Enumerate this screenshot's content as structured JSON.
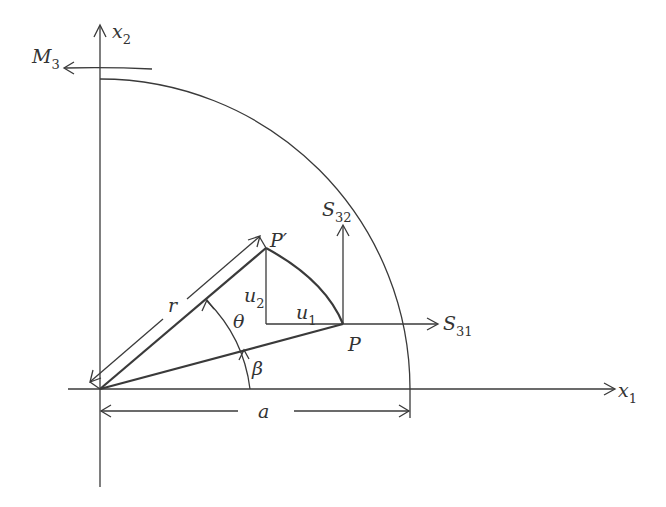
{
  "diagram": {
    "type": "mechanics-figure",
    "colors": {
      "line": "#3a3a3a",
      "text": "#333333",
      "background": "#ffffff"
    },
    "labels": {
      "x2_axis": {
        "base": "x",
        "sub": "2"
      },
      "x1_axis": {
        "base": "x",
        "sub": "1"
      },
      "moment": {
        "base": "M",
        "sub": "3"
      },
      "S32": {
        "base": "S",
        "sub": "32"
      },
      "S31": {
        "base": "S",
        "sub": "31"
      },
      "P_prime": "P′",
      "P": "P",
      "r": "r",
      "theta": "θ",
      "beta": "β",
      "u1": {
        "base": "u",
        "sub": "1"
      },
      "u2": {
        "base": "u",
        "sub": "2"
      },
      "a": "a"
    },
    "elements": [
      "x1 axis (horizontal, arrow right)",
      "x2 axis (vertical, arrow up)",
      "quarter-circle boundary of radius a",
      "curved moment arrow M3 (counter-clockwise)",
      "line O-P at angle beta",
      "line O-P' at angle beta+theta",
      "arc P-P' (displacement path)",
      "displacement components u1 (horizontal) and u2 (vertical)",
      "stress vectors S31 (horizontal) and S32 (vertical) at P",
      "dimension r along O-P'",
      "dimension a along x1 axis",
      "angle arcs theta and beta"
    ]
  }
}
